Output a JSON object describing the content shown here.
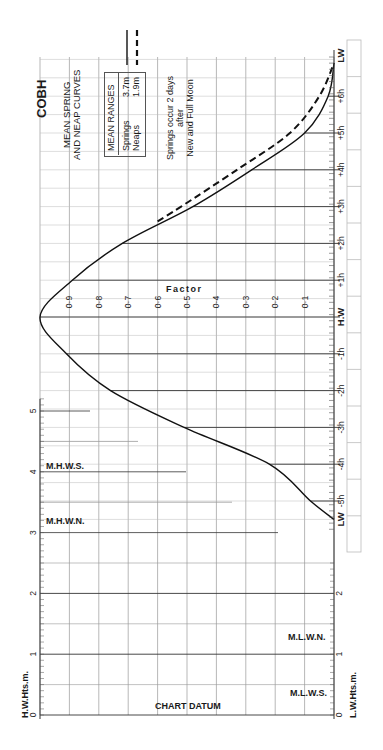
{
  "title": "COBH",
  "subtitle_lines": [
    "MEAN SPRING",
    "AND NEAP CURVES"
  ],
  "legend": {
    "header": "MEAN RANGES",
    "rows": [
      {
        "name": "Springs",
        "value": "3.7m",
        "style": "solid"
      },
      {
        "name": "Neaps",
        "value": "1.9m",
        "style": "dashed"
      }
    ]
  },
  "note_lines": [
    "Springs occur 2 days",
    "after",
    "New and Full Moon"
  ],
  "factor_label": "Factor",
  "hw_axis_label": "H.W.Hts.m.",
  "lw_axis_label": "L.W.Hts.m.",
  "chart_datum_label": "CHART DATUM",
  "levels": {
    "mhws": "M.H.W.S.",
    "mhwn": "M.H.W.N.",
    "mlwn": "M.L.W.N.",
    "mlws": "M.L.W.S."
  },
  "chart_data": {
    "type": "line",
    "xlabel": "Time relative to High Water",
    "ylabel": "Factor",
    "time_ticks": [
      "LW",
      "-5h",
      "-4h",
      "-3h",
      "-2h",
      "-1h",
      "H.W",
      "+1h",
      "+2h",
      "+3h",
      "+4h",
      "+5h",
      "+6h",
      "LW"
    ],
    "factor_ticks": [
      "0·1",
      "0·2",
      "0·3",
      "0·4",
      "0·5",
      "0·6",
      "0·7",
      "0·8",
      "0·9"
    ],
    "hw_height_ticks": [
      "0",
      "1",
      "2",
      "3",
      "4",
      "5"
    ],
    "lw_height_ticks": [
      "0",
      "1",
      "2"
    ],
    "series": [
      {
        "name": "Springs (3.7m)",
        "style": "solid",
        "x": [
          -5.5,
          -5,
          -4,
          -3,
          -2,
          -1,
          0,
          1,
          2,
          3,
          4,
          5,
          6,
          6.9
        ],
        "values": [
          0.0,
          0.08,
          0.22,
          0.51,
          0.76,
          0.91,
          1.0,
          0.89,
          0.72,
          0.48,
          0.28,
          0.1,
          0.02,
          0.0
        ]
      },
      {
        "name": "Neaps (1.9m)",
        "style": "dashed",
        "x": [
          2.6,
          3,
          4,
          5,
          6,
          6.9
        ],
        "values": [
          0.6,
          0.52,
          0.33,
          0.15,
          0.05,
          0.0
        ]
      }
    ],
    "levels_m": {
      "M.H.W.S.": 4.1,
      "M.H.W.N.": 3.2,
      "M.L.W.N.": 1.3,
      "M.L.W.S.": 0.4
    },
    "ylim": [
      0,
      1
    ],
    "grid": true
  }
}
